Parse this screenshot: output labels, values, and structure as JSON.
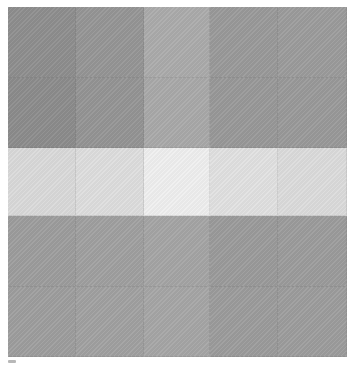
{
  "artwork": {
    "type": "abstract grid painting",
    "grid": {
      "columns": 5,
      "rows": 5
    },
    "cells": [
      [
        "#8e8e8e",
        "#969696",
        "#ababab",
        "#9a9a9a",
        "#9c9c9c"
      ],
      [
        "#8c8c8c",
        "#959595",
        "#a9a9a9",
        "#999999",
        "#9a9a9a"
      ],
      [
        "#dadada",
        "#dedede",
        "#efefef",
        "#e1e1e1",
        "#dcdcdc"
      ],
      [
        "#9d9d9d",
        "#a0a0a0",
        "#a5a5a5",
        "#9b9b9b",
        "#9c9c9c"
      ],
      [
        "#9e9e9e",
        "#a1a1a1",
        "#a6a6a6",
        "#9c9c9c",
        "#9d9d9d"
      ]
    ]
  }
}
